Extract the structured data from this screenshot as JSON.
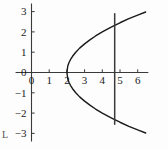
{
  "figure": {
    "label": "L",
    "background": "#fdfdfd",
    "ink_color": "#1a1a1a",
    "axis_color": "#3a3a3a"
  },
  "chart_data": {
    "type": "line",
    "title": "",
    "xlabel": "",
    "ylabel": "",
    "xlim": [
      -0.9,
      6.6
    ],
    "ylim": [
      -3.4,
      3.4
    ],
    "grid": false,
    "legend": null,
    "xticks": [
      0,
      1,
      2,
      3,
      4,
      5,
      6
    ],
    "xtick_labels": [
      "0",
      "1",
      "2",
      "3",
      "4",
      "5",
      "6"
    ],
    "yticks": [
      -3,
      -2,
      -1,
      0,
      1,
      2,
      3
    ],
    "ytick_labels": [
      "-3",
      "-2",
      "-1",
      "0",
      "1",
      "2",
      "3"
    ],
    "series": [
      {
        "name": "parabola-upper-branch",
        "equation": "x = 2 + y^2/2, y >= 0",
        "color": "#1a1a1a",
        "points": [
          [
            2.0,
            0.0
          ],
          [
            2.05,
            0.32
          ],
          [
            2.12,
            0.49
          ],
          [
            2.2,
            0.63
          ],
          [
            2.32,
            0.8
          ],
          [
            2.5,
            1.0
          ],
          [
            2.72,
            1.2
          ],
          [
            3.0,
            1.41
          ],
          [
            3.3,
            1.61
          ],
          [
            3.62,
            1.8
          ],
          [
            4.0,
            2.0
          ],
          [
            4.42,
            2.2
          ],
          [
            4.7,
            2.32
          ],
          [
            5.0,
            2.45
          ],
          [
            5.5,
            2.65
          ],
          [
            6.0,
            2.83
          ],
          [
            6.45,
            2.98
          ]
        ]
      },
      {
        "name": "parabola-lower-branch",
        "equation": "x = 2 + y^2/2, y <= 0",
        "color": "#1a1a1a",
        "points": [
          [
            2.0,
            0.0
          ],
          [
            2.05,
            -0.32
          ],
          [
            2.12,
            -0.49
          ],
          [
            2.2,
            -0.63
          ],
          [
            2.32,
            -0.8
          ],
          [
            2.5,
            -1.0
          ],
          [
            2.72,
            -1.2
          ],
          [
            3.0,
            -1.41
          ],
          [
            3.3,
            -1.61
          ],
          [
            3.62,
            -1.8
          ],
          [
            4.0,
            -2.0
          ],
          [
            4.42,
            -2.2
          ],
          [
            4.7,
            -2.32
          ],
          [
            5.0,
            -2.45
          ],
          [
            5.5,
            -2.65
          ],
          [
            6.0,
            -2.83
          ],
          [
            6.45,
            -2.98
          ]
        ]
      },
      {
        "name": "vertical-line",
        "equation": "x = 4.7",
        "color": "#3a3a3a",
        "points": [
          [
            4.7,
            -2.55
          ],
          [
            4.7,
            2.9
          ]
        ]
      }
    ],
    "annotations": [
      {
        "text": "L",
        "x": -0.8,
        "y": -3.0,
        "name": "figure-label"
      }
    ]
  }
}
